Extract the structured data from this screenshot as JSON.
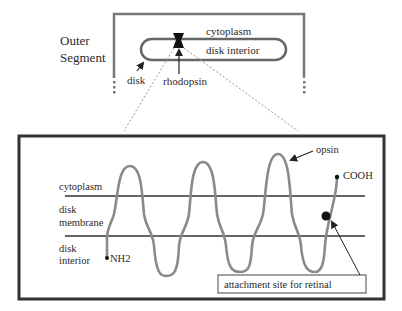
{
  "top_panel": {
    "title_line1": "Outer",
    "title_line2": "Segment",
    "cytoplasm_label": "cytoplasm",
    "disk_interior_label": "disk interior",
    "disk_label": "disk",
    "rhodopsin_label": "rhodopsin"
  },
  "bottom_panel": {
    "cytoplasm_label": "cytoplasm",
    "membrane_label_line1": "disk",
    "membrane_label_line2": "membrane",
    "interior_label_line1": "disk",
    "interior_label_line2": "interior",
    "nh2_label": "NH2",
    "cooh_label": "COOH",
    "opsin_label": "opsin",
    "retinal_callout": "attachment site for retinal"
  },
  "colors": {
    "frame": "#3a3a3a",
    "protein_chain": "#8a8a8a",
    "dotted_zoom": "#9a9a9a",
    "text": "#2a2a2a"
  }
}
